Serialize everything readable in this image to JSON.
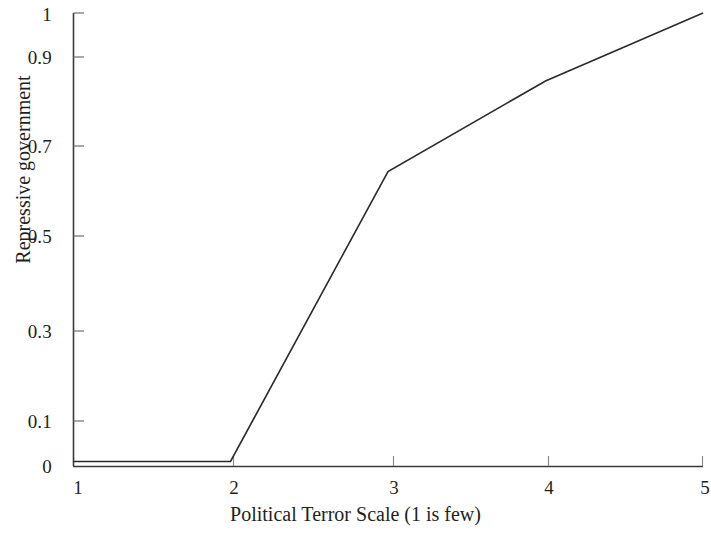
{
  "chart_data": {
    "type": "line",
    "title": "",
    "xlabel": "Political Terror Scale (1 is few)",
    "ylabel": "Repressive government",
    "x": [
      1,
      2,
      3,
      4,
      5
    ],
    "values": [
      0.01,
      0.01,
      0.65,
      0.85,
      1.0
    ],
    "series": [
      {
        "name": "Repressive government",
        "x": [
          1,
          2,
          3,
          4,
          5
        ],
        "values": [
          0.01,
          0.01,
          0.65,
          0.85,
          1.0
        ]
      }
    ],
    "xlim": [
      1,
      5
    ],
    "ylim": [
      0,
      1
    ],
    "xticks": [
      1,
      2,
      3,
      4,
      5
    ],
    "xtick_labels": [
      "1",
      "2",
      "3",
      "4",
      "5"
    ],
    "yticks": [
      0,
      0.1,
      0.3,
      0.5,
      0.7,
      0.9,
      1
    ],
    "ytick_labels": [
      "0",
      "0.1",
      "0.3",
      "0.5",
      "0.7",
      "0.9",
      "1"
    ],
    "grid": false,
    "legend": null,
    "line_color": "#2b2b2b",
    "axis_color": "#3a3a3a",
    "background_color": "#ffffff"
  },
  "axes": {
    "y_title": "Repressive government",
    "x_title": "Political Terror Scale (1 is few)",
    "y_labels": [
      "1",
      "0.9",
      "0.7",
      "0.5",
      "0.3",
      "0.1",
      "0"
    ],
    "x_labels": [
      "1",
      "2",
      "3",
      "4",
      "5"
    ]
  }
}
